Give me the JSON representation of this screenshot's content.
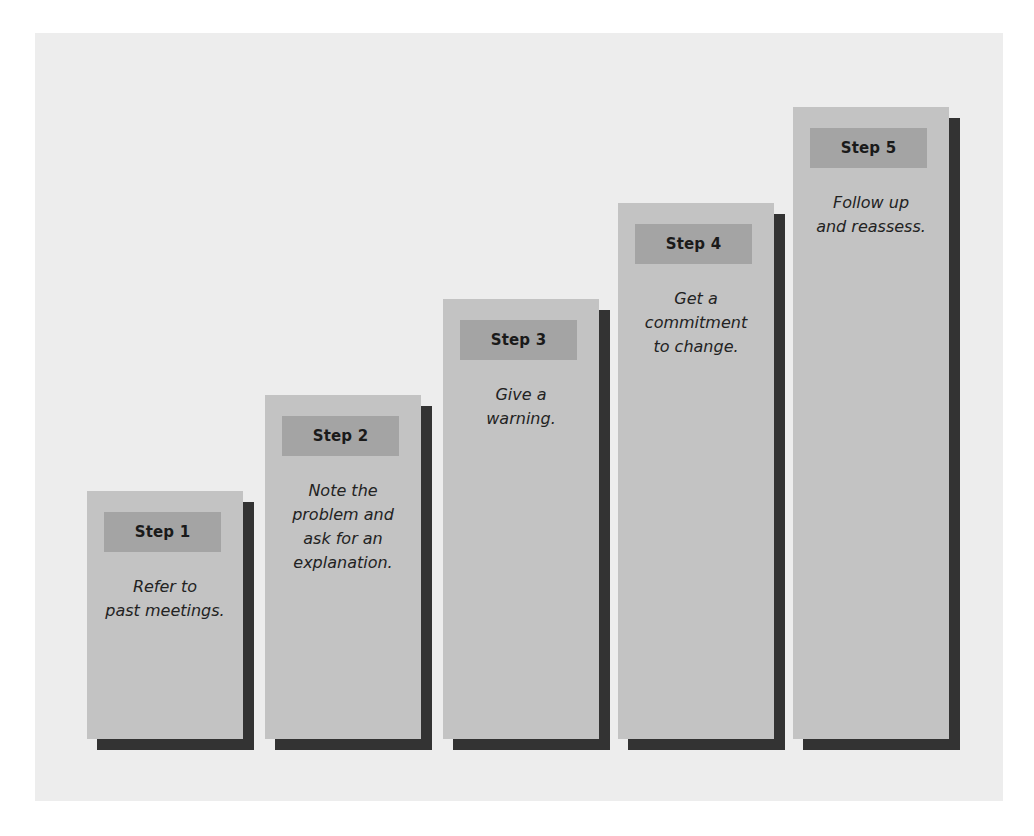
{
  "diagram": {
    "type": "staircase-steps",
    "colors": {
      "background": "#ffffff",
      "panel": "#ededed",
      "card": "#c3c3c3",
      "label": "#a4a4a4",
      "shadow": "#333333",
      "text": "#1a1a1a"
    },
    "steps": [
      {
        "label": "Step 1",
        "description": "Refer to\npast meetings."
      },
      {
        "label": "Step 2",
        "description": "Note the\nproblem and\nask for an\nexplanation."
      },
      {
        "label": "Step 3",
        "description": "Give a\nwarning."
      },
      {
        "label": "Step 4",
        "description": "Get a\ncommitment\nto change."
      },
      {
        "label": "Step 5",
        "description": "Follow up\nand reassess."
      }
    ]
  }
}
